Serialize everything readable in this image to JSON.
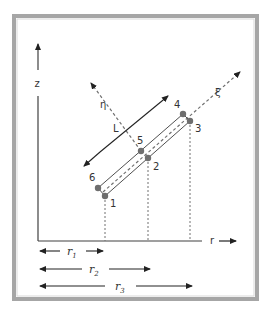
{
  "diagram": {
    "type": "element geometry schematic",
    "axes": {
      "vertical": "z",
      "horizontal": "r",
      "local_axis_1": "ξ",
      "local_axis_2": "η"
    },
    "length_label": "L",
    "nodes": [
      {
        "id": "1",
        "label": "1"
      },
      {
        "id": "2",
        "label": "2"
      },
      {
        "id": "3",
        "label": "3"
      },
      {
        "id": "4",
        "label": "4"
      },
      {
        "id": "5",
        "label": "5"
      },
      {
        "id": "6",
        "label": "6"
      }
    ],
    "dimensions": [
      {
        "label": "r",
        "sub": "1"
      },
      {
        "label": "r",
        "sub": "2"
      },
      {
        "label": "r",
        "sub": "3"
      }
    ]
  },
  "colors": {
    "frame": "#a6a6a6",
    "lines": "#404040",
    "nodes": "#6e6e6e",
    "dashed": "#707070"
  }
}
